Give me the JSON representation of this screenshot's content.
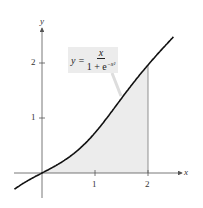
{
  "figure": {
    "equation_lhs": "y =",
    "equation_numerator": "x",
    "equation_denominator": "1 + e",
    "equation_exponent": "−x²",
    "x_axis_label": "x",
    "y_axis_label": "y",
    "x_ticks": [
      "1",
      "2"
    ],
    "y_ticks": [
      "1",
      "2"
    ],
    "shade_color": "#ececec",
    "curve_color": "#111111"
  },
  "chart_data": {
    "type": "line",
    "title": "",
    "function": "y = x / (1 + e^(-x^2))",
    "xlabel": "x",
    "ylabel": "y",
    "xlim": [
      -0.5,
      2.5
    ],
    "ylim": [
      -0.4,
      2.6
    ],
    "x_ticks": [
      1,
      2
    ],
    "y_ticks": [
      1,
      2
    ],
    "shaded_region": {
      "from": 0,
      "to": 2,
      "description": "area under curve from x=0 to x=2"
    },
    "x": [
      -0.5,
      0,
      0.5,
      1,
      1.5,
      2,
      2.5
    ],
    "values": [
      -0.22,
      0,
      0.28,
      0.73,
      1.36,
      1.96,
      2.49
    ],
    "grid": false,
    "legend": "none"
  }
}
